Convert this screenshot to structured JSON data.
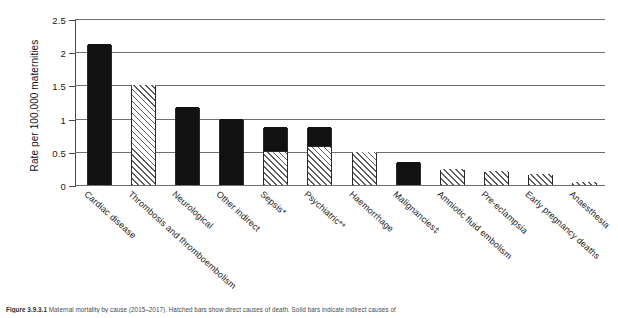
{
  "chart_data": {
    "type": "bar",
    "title": "",
    "xlabel": "",
    "ylabel": "Rate per 100,000 maternities",
    "ylim": [
      0,
      2.5
    ],
    "ytick_values": [
      0,
      0.5,
      1,
      1.5,
      2,
      2.5
    ],
    "ytick_labels": [
      "0",
      "0.5",
      "1",
      "1.5",
      "2",
      "2.5"
    ],
    "grid": "horizontal",
    "legend": "none",
    "categories": [
      "Cardiac disease",
      "Thrombosis and thromboembolism",
      "Neurological",
      "Other indirect",
      "Sepsis*",
      "Psychiatric**",
      "Haemorrhage",
      "Malignancies‡",
      "Amniotic fluid embolism",
      "Pre-eclampsia",
      "Early pregnancy deaths",
      "Anaesthesia"
    ],
    "values": [
      2.12,
      1.5,
      1.18,
      1.0,
      0.87,
      0.87,
      0.5,
      0.35,
      0.24,
      0.21,
      0.17,
      0.04
    ],
    "bars": [
      {
        "label": "Cardiac disease",
        "value": 2.12,
        "fill": "solid",
        "segments": [
          {
            "from": 0,
            "to": 2.12,
            "fill": "solid"
          }
        ]
      },
      {
        "label": "Thrombosis and thromboembolism",
        "value": 1.5,
        "fill": "hatch",
        "segments": [
          {
            "from": 0,
            "to": 1.5,
            "fill": "hatch"
          }
        ]
      },
      {
        "label": "Neurological",
        "value": 1.18,
        "fill": "solid",
        "segments": [
          {
            "from": 0,
            "to": 1.18,
            "fill": "solid"
          }
        ]
      },
      {
        "label": "Other indirect",
        "value": 1.0,
        "fill": "solid",
        "segments": [
          {
            "from": 0,
            "to": 1.0,
            "fill": "solid"
          }
        ]
      },
      {
        "label": "Sepsis*",
        "value": 0.87,
        "fill": "split",
        "segments": [
          {
            "from": 0,
            "to": 0.5,
            "fill": "hatch"
          },
          {
            "from": 0.5,
            "to": 0.87,
            "fill": "solid"
          }
        ]
      },
      {
        "label": "Psychiatric**",
        "value": 0.87,
        "fill": "split",
        "segments": [
          {
            "from": 0,
            "to": 0.57,
            "fill": "hatch"
          },
          {
            "from": 0.57,
            "to": 0.87,
            "fill": "solid"
          }
        ]
      },
      {
        "label": "Haemorrhage",
        "value": 0.5,
        "fill": "hatch",
        "segments": [
          {
            "from": 0,
            "to": 0.5,
            "fill": "hatch"
          }
        ]
      },
      {
        "label": "Malignancies‡",
        "value": 0.35,
        "fill": "solid",
        "segments": [
          {
            "from": 0,
            "to": 0.35,
            "fill": "solid"
          }
        ]
      },
      {
        "label": "Amniotic fluid embolism",
        "value": 0.24,
        "fill": "hatch",
        "segments": [
          {
            "from": 0,
            "to": 0.24,
            "fill": "hatch"
          }
        ]
      },
      {
        "label": "Pre-eclampsia",
        "value": 0.21,
        "fill": "hatch",
        "segments": [
          {
            "from": 0,
            "to": 0.21,
            "fill": "hatch"
          }
        ]
      },
      {
        "label": "Early pregnancy deaths",
        "value": 0.17,
        "fill": "hatch",
        "segments": [
          {
            "from": 0,
            "to": 0.17,
            "fill": "hatch"
          }
        ]
      },
      {
        "label": "Anaesthesia",
        "value": 0.04,
        "fill": "hatch",
        "segments": [
          {
            "from": 0,
            "to": 0.04,
            "fill": "hatch"
          }
        ]
      }
    ]
  },
  "caption": {
    "figure_number": "Figure 3.9.3.1",
    "text": "Maternal mortality by cause (2015–2017). Hatched bars show direct causes of death. Solid bars indicate indirect causes of"
  },
  "colors": {
    "solid_fill": "#111111",
    "hatch_line": "#5d5d5d",
    "grid": "#6f6f6f",
    "axis": "#4a4a4a",
    "text": "#1b1b1b"
  }
}
